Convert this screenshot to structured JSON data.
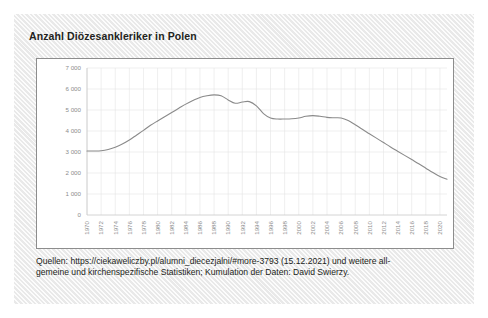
{
  "card": {
    "title": "Anzahl Diözesankleriker in Polen"
  },
  "caption": {
    "line1": "Quellen: https://ciekaweliczby.pl/alumni_diecezjalni/#more-3793 (15.12.2021) und weitere all-",
    "line2": "gemeine und kirchenspezifische Statistiken; Kumulation der Daten: David Swierzy."
  },
  "chart_data": {
    "type": "line",
    "title": "Anzahl Diözesankleriker in Polen",
    "xlabel": "",
    "ylabel": "",
    "xlim": [
      1970,
      2021
    ],
    "ylim": [
      0,
      7000
    ],
    "grid": true,
    "legend": false,
    "line_color": "#8a8a8a",
    "ytick_values": [
      0,
      1000,
      2000,
      3000,
      4000,
      5000,
      6000,
      7000
    ],
    "ytick_labels": [
      "0",
      "1 000",
      "2 000",
      "3 000",
      "4 000",
      "5 000",
      "6 000",
      "7 000"
    ],
    "xtick_labels": [
      "1970",
      "1972",
      "1974",
      "1976",
      "1978",
      "1980",
      "1982",
      "1984",
      "1986",
      "1988",
      "1990",
      "1992",
      "1994",
      "1996",
      "1998",
      "2000",
      "2002",
      "2004",
      "2006",
      "2008",
      "2010",
      "2012",
      "2014",
      "2016",
      "2018",
      "2020"
    ],
    "series": [
      {
        "name": "Anzahl Diözesankleriker",
        "x": [
          1970,
          1971,
          1972,
          1973,
          1974,
          1975,
          1976,
          1977,
          1978,
          1979,
          1980,
          1981,
          1982,
          1983,
          1984,
          1985,
          1986,
          1987,
          1988,
          1989,
          1990,
          1991,
          1992,
          1993,
          1994,
          1995,
          1996,
          1997,
          1998,
          1999,
          2000,
          2001,
          2002,
          2003,
          2004,
          2005,
          2006,
          2007,
          2008,
          2009,
          2010,
          2011,
          2012,
          2013,
          2014,
          2015,
          2016,
          2017,
          2018,
          2019,
          2020,
          2021
        ],
        "values": [
          3050,
          3050,
          3060,
          3120,
          3230,
          3380,
          3570,
          3800,
          4030,
          4270,
          4480,
          4680,
          4880,
          5080,
          5280,
          5450,
          5600,
          5680,
          5720,
          5680,
          5480,
          5320,
          5380,
          5400,
          5200,
          4830,
          4620,
          4570,
          4570,
          4580,
          4620,
          4700,
          4730,
          4700,
          4650,
          4630,
          4620,
          4500,
          4300,
          4080,
          3870,
          3660,
          3450,
          3240,
          3040,
          2840,
          2640,
          2440,
          2230,
          2020,
          1830,
          1700
        ]
      }
    ]
  }
}
